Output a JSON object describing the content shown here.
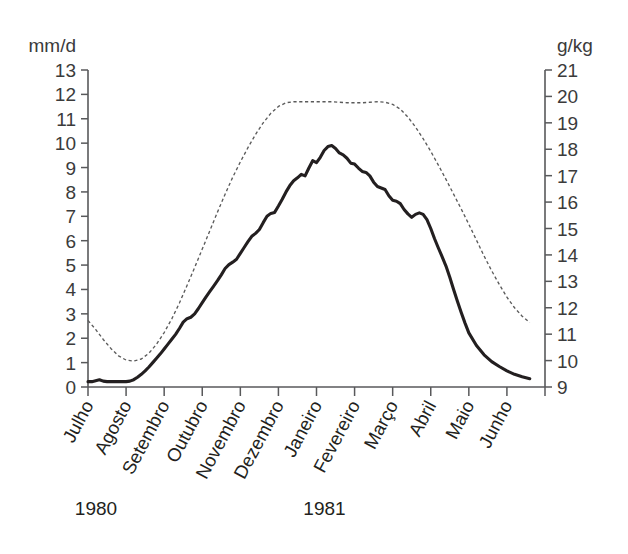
{
  "chart_data": {
    "type": "line",
    "title": "",
    "subtitle": "",
    "xlabel": "",
    "ylabel": "mm/d",
    "y2label": "g/kg",
    "grid": false,
    "legend": "none",
    "axes": {
      "left": {
        "unit": "mm/d",
        "ylim": [
          0,
          13
        ],
        "ticks": [
          0,
          1,
          2,
          3,
          4,
          5,
          6,
          7,
          8,
          9,
          10,
          11,
          12,
          13
        ],
        "tick_labels": [
          "0",
          "1",
          "2",
          "3",
          "4",
          "5",
          "6",
          "7",
          "8",
          "9",
          "10",
          "11",
          "12",
          "13"
        ]
      },
      "right": {
        "unit": "g/kg",
        "ylim": [
          9,
          21
        ],
        "ticks": [
          9,
          10,
          11,
          12,
          13,
          14,
          15,
          16,
          17,
          18,
          19,
          20,
          21
        ],
        "tick_labels": [
          "9",
          "10",
          "11",
          "12",
          "13",
          "14",
          "15",
          "16",
          "17",
          "18",
          "19",
          "20",
          "21"
        ]
      },
      "x": {
        "categories": [
          "Julho",
          "Agosto",
          "Setembro",
          "Outubro",
          "Novembro",
          "Dezembro",
          "Janeiro",
          "Fevereiro",
          "Março",
          "Abril",
          "Maio",
          "Junho"
        ],
        "years": [
          {
            "label": "1980",
            "at_category": "Julho"
          },
          {
            "label": "1981",
            "at_category": "Janeiro"
          }
        ]
      }
    },
    "series": [
      {
        "name": "evaporation",
        "style": "solid",
        "axis": "left",
        "unit": "mm/d",
        "color": "#231f20",
        "x": [
          0.0,
          0.1,
          0.2,
          0.3,
          0.4,
          0.5,
          0.6,
          0.7,
          0.8,
          0.9,
          1.0,
          1.1,
          1.2,
          1.3,
          1.4,
          1.5,
          1.6,
          1.7,
          1.8,
          1.9,
          2.0,
          2.1,
          2.2,
          2.3,
          2.4,
          2.5,
          2.6,
          2.7,
          2.8,
          2.9,
          3.0,
          3.1,
          3.2,
          3.3,
          3.4,
          3.5,
          3.6,
          3.7,
          3.8,
          3.9,
          4.0,
          4.1,
          4.2,
          4.3,
          4.4,
          4.5,
          4.6,
          4.7,
          4.8,
          4.9,
          5.0,
          5.1,
          5.2,
          5.3,
          5.4,
          5.5,
          5.6,
          5.7,
          5.8,
          5.9,
          6.0,
          6.1,
          6.2,
          6.3,
          6.4,
          6.5,
          6.6,
          6.7,
          6.8,
          6.9,
          7.0,
          7.1,
          7.2,
          7.3,
          7.4,
          7.5,
          7.6,
          7.7,
          7.8,
          7.9,
          8.0,
          8.1,
          8.2,
          8.3,
          8.4,
          8.5,
          8.6,
          8.7,
          8.8,
          8.9,
          9.0,
          9.1,
          9.2,
          9.3,
          9.4,
          9.5,
          9.6,
          9.7,
          9.8,
          9.9,
          10.0,
          10.2,
          10.4,
          10.6,
          10.8,
          11.0,
          11.2,
          11.4,
          11.6
        ],
        "y": [
          0.22,
          0.22,
          0.26,
          0.3,
          0.24,
          0.22,
          0.22,
          0.22,
          0.22,
          0.22,
          0.22,
          0.24,
          0.3,
          0.4,
          0.52,
          0.66,
          0.82,
          1.0,
          1.18,
          1.36,
          1.56,
          1.76,
          1.96,
          2.16,
          2.4,
          2.66,
          2.8,
          2.86,
          3.0,
          3.22,
          3.46,
          3.7,
          3.92,
          4.14,
          4.36,
          4.6,
          4.86,
          5.02,
          5.12,
          5.24,
          5.48,
          5.72,
          5.96,
          6.18,
          6.3,
          6.46,
          6.74,
          7.0,
          7.12,
          7.16,
          7.42,
          7.7,
          8.0,
          8.26,
          8.46,
          8.58,
          8.72,
          8.66,
          8.98,
          9.28,
          9.2,
          9.42,
          9.7,
          9.86,
          9.9,
          9.78,
          9.6,
          9.52,
          9.38,
          9.18,
          9.14,
          8.98,
          8.84,
          8.8,
          8.66,
          8.4,
          8.22,
          8.16,
          8.1,
          7.84,
          7.66,
          7.62,
          7.52,
          7.28,
          7.1,
          6.96,
          7.08,
          7.14,
          7.08,
          6.86,
          6.5,
          6.08,
          5.7,
          5.34,
          4.96,
          4.5,
          4.0,
          3.52,
          3.06,
          2.62,
          2.22,
          1.7,
          1.32,
          1.04,
          0.84,
          0.66,
          0.52,
          0.42,
          0.34
        ],
        "notes": "peak ~9.9 mm/d in late Dezembro/Janeiro; minimum ~0.2 mm/d in Julho-Agosto"
      },
      {
        "name": "specific-humidity",
        "style": "dashed",
        "axis": "right",
        "unit": "g/kg",
        "color": "#5b5b5b",
        "x": [
          0.0,
          0.2,
          0.4,
          0.6,
          0.8,
          1.0,
          1.2,
          1.4,
          1.6,
          1.8,
          2.0,
          2.2,
          2.4,
          2.6,
          2.8,
          3.0,
          3.2,
          3.4,
          3.6,
          3.8,
          4.0,
          4.2,
          4.4,
          4.6,
          4.8,
          5.0,
          5.2,
          5.4,
          5.6,
          5.8,
          6.0,
          6.2,
          6.4,
          6.6,
          6.8,
          7.0,
          7.2,
          7.4,
          7.6,
          7.8,
          8.0,
          8.2,
          8.4,
          8.6,
          8.8,
          9.0,
          9.2,
          9.4,
          9.6,
          9.8,
          10.0,
          10.2,
          10.4,
          10.6,
          10.8,
          11.0,
          11.2,
          11.4,
          11.6
        ],
        "y": [
          11.52,
          11.18,
          10.8,
          10.46,
          10.18,
          10.02,
          9.98,
          10.06,
          10.28,
          10.62,
          11.06,
          11.58,
          12.18,
          12.84,
          13.52,
          14.22,
          14.92,
          15.62,
          16.3,
          16.94,
          17.52,
          18.06,
          18.56,
          19.0,
          19.36,
          19.62,
          19.76,
          19.8,
          19.8,
          19.8,
          19.8,
          19.8,
          19.8,
          19.78,
          19.76,
          19.76,
          19.76,
          19.78,
          19.8,
          19.78,
          19.7,
          19.52,
          19.22,
          18.84,
          18.4,
          17.92,
          17.4,
          16.86,
          16.3,
          15.74,
          15.16,
          14.56,
          13.96,
          13.4,
          12.88,
          12.4,
          12.0,
          11.68,
          11.44
        ],
        "notes": "plateau ~19.8 g/kg from Dezembro through Março; minimum ~10.0 g/kg in Agosto"
      }
    ]
  }
}
